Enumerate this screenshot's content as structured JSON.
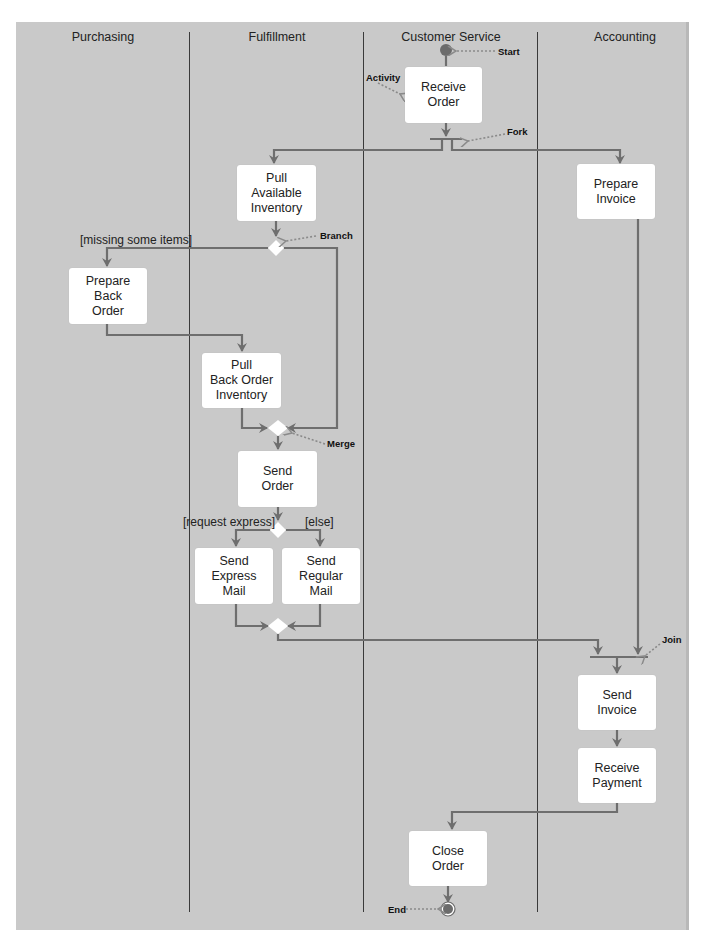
{
  "diagram": {
    "type": "UML activity diagram (swimlanes)",
    "lanes": [
      {
        "id": "purchasing",
        "label": "Purchasing"
      },
      {
        "id": "fulfillment",
        "label": "Fulfillment"
      },
      {
        "id": "customer_service",
        "label": "Customer Service"
      },
      {
        "id": "accounting",
        "label": "Accounting"
      }
    ],
    "activities": {
      "receive_order": "Receive\nOrder",
      "pull_available_inventory": "Pull\nAvailable\nInventory",
      "prepare_invoice": "Prepare\nInvoice",
      "prepare_back_order": "Prepare\nBack\nOrder",
      "pull_back_order_inventory": "Pull\nBack Order\nInventory",
      "send_order": "Send\nOrder",
      "send_express_mail": "Send\nExpress\nMail",
      "send_regular_mail": "Send\nRegular\nMail",
      "send_invoice": "Send\nInvoice",
      "receive_payment": "Receive\nPayment",
      "close_order": "Close\nOrder"
    },
    "annotations": {
      "start": "Start",
      "activity": "Activity",
      "fork": "Fork",
      "branch": "Branch",
      "merge": "Merge",
      "join": "Join",
      "end": "End"
    },
    "guards": {
      "missing_items": "[missing some items]",
      "request_express": "[request express]",
      "else": "[else]"
    },
    "colors": {
      "background": "#c9c9c9",
      "node_fill": "#ffffff",
      "flow_line": "#6e6e6e",
      "divider": "#3a3a3a",
      "start_end_dot": "#6b6b6b"
    }
  }
}
